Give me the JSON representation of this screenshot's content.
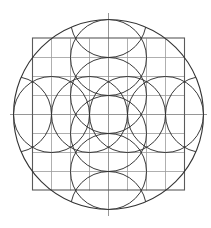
{
  "diagram": {
    "title": "",
    "grid": {
      "divisions": 8
    },
    "outer_circle": {
      "count": 1
    },
    "axis_circles": {
      "radius_in_grid_units": 2,
      "offsets_in_grid_units": [
        -5,
        -3,
        -1,
        1,
        3,
        5
      ],
      "axes": [
        "horizontal",
        "vertical"
      ]
    },
    "colors": {
      "background": "#ffffff",
      "circle_stroke": "#2e2e2e",
      "square_stroke": "#5a5a5a",
      "grid_stroke": "#9a9a9a"
    }
  }
}
